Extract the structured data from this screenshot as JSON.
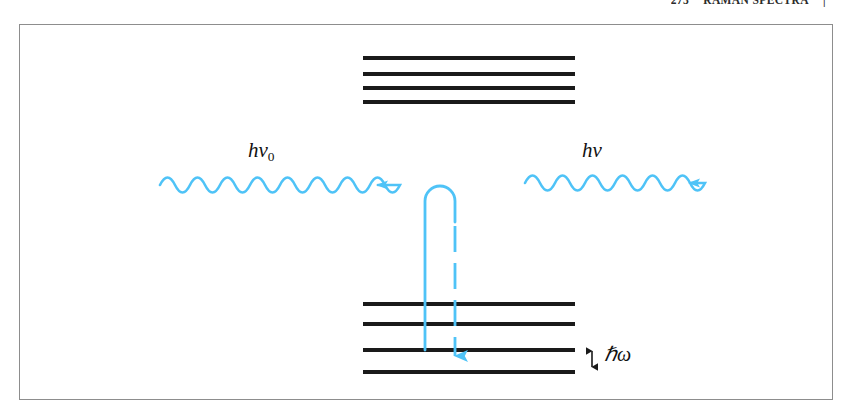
{
  "page": {
    "background_color": "#ffffff",
    "width": 851,
    "height": 417
  },
  "running_head": {
    "page_number": "273",
    "title": "RAMAN SPECTRA",
    "folio_right": "|"
  },
  "figure": {
    "frame": {
      "border_color": "#8d8d8d",
      "x": 19,
      "y": 24,
      "width": 814,
      "height": 376
    },
    "level_color": "#1a1a1a",
    "accent_color": "#4FC3F7",
    "upper_levels": {
      "name": "virtual-excited-state-levels",
      "count": 4,
      "x": 363,
      "width": 212,
      "y_positions": [
        56,
        72,
        86,
        100
      ]
    },
    "lower_levels": {
      "name": "vibrational-ground-state-levels",
      "count": 4,
      "x": 363,
      "width": 212,
      "y_positions": [
        302,
        322,
        348,
        370
      ]
    },
    "incoming_photon": {
      "label": "hν₀",
      "label_h": "h",
      "label_nu": "ν",
      "label_sub": "0",
      "direction": "right",
      "arch_count": 8,
      "x_start": 160,
      "x_end": 400,
      "y": 185
    },
    "outgoing_photon": {
      "label": "hν",
      "label_h": "h",
      "label_nu": "ν",
      "direction": "right",
      "arch_count": 6,
      "x_start": 525,
      "x_end": 710,
      "y": 183
    },
    "transition_path": {
      "name": "raman-scattering-transition",
      "up_line_style": "solid",
      "down_line_style": "dashed",
      "up_x": 425,
      "down_x": 455,
      "top_y": 186,
      "up_start_y": 348,
      "down_end_y": 370,
      "arrowhead": "down"
    },
    "spacing_annotation": {
      "label": "ℏω",
      "label_hbar": "ℏ",
      "label_omega": "ω",
      "arrow_type": "double-headed-vertical",
      "x": 592,
      "y_top": 348,
      "y_bottom": 370
    }
  }
}
